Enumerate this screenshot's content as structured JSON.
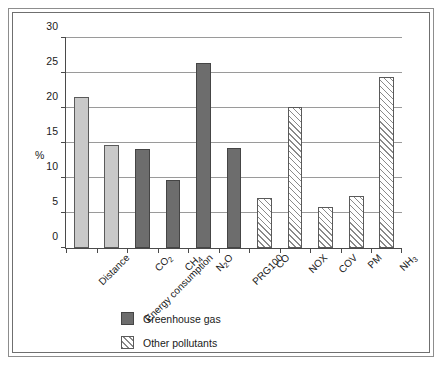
{
  "chart_data": {
    "type": "bar",
    "title": "",
    "xlabel": "",
    "ylabel": "%",
    "ylim": [
      0,
      30
    ],
    "yticks": [
      0,
      5,
      10,
      15,
      20,
      25,
      30
    ],
    "grid": true,
    "legend_position": "bottom-left",
    "categories": [
      "Distance",
      "Energy consumption",
      "CO2",
      "CH4",
      "N2O",
      "PRG100",
      "CO",
      "NOX",
      "COV",
      "PM",
      "NH3"
    ],
    "category_labels_html": [
      "Distance",
      "Energy consumption",
      "CO<sub>2</sub>",
      "CH<sub>4</sub>",
      "N<sub>2</sub>O",
      "PRG100",
      "CO",
      "NOX",
      "COV",
      "PM",
      "NH<sub>3</sub>"
    ],
    "values": [
      21.6,
      14.7,
      14.1,
      9.7,
      26.5,
      14.3,
      7.2,
      20.2,
      5.8,
      7.4,
      24.5
    ],
    "bar_styles": [
      "light",
      "light",
      "dark",
      "dark",
      "dark",
      "dark",
      "hatch",
      "hatch",
      "hatch",
      "hatch",
      "hatch"
    ],
    "legend": [
      {
        "label": "Greenhouse gas",
        "style": "dark"
      },
      {
        "label": "Other pollutants",
        "style": "hatch"
      }
    ],
    "colors": {
      "light_bar": "#c9c9c9",
      "dark_bar": "#6d6d6d",
      "hatch_line": "#8a8a8a",
      "axis": "#4a4a4a",
      "gridline": "#9a9a9a",
      "frame": "#8d8d8d",
      "text": "#1a1a1a"
    }
  }
}
